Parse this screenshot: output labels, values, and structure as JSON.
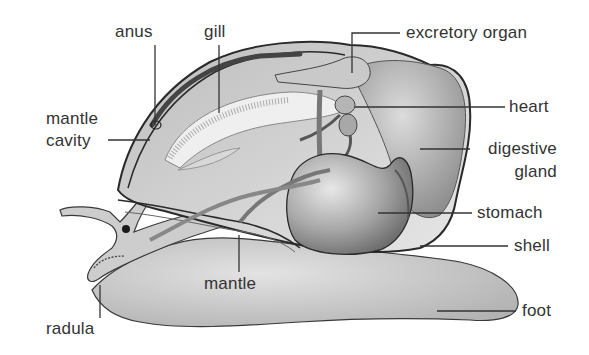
{
  "diagram": {
    "labels": [
      {
        "id": "anus",
        "text": "anus"
      },
      {
        "id": "gill",
        "text": "gill"
      },
      {
        "id": "mantle-cavity-1",
        "text": "mantle"
      },
      {
        "id": "mantle-cavity-2",
        "text": "cavity"
      },
      {
        "id": "excretory-organ",
        "text": "excretory organ"
      },
      {
        "id": "heart",
        "text": "heart"
      },
      {
        "id": "digestive-gland-1",
        "text": "digestive"
      },
      {
        "id": "digestive-gland-2",
        "text": "gland"
      },
      {
        "id": "stomach",
        "text": "stomach"
      },
      {
        "id": "shell",
        "text": "shell"
      },
      {
        "id": "mantle",
        "text": "mantle"
      },
      {
        "id": "foot",
        "text": "foot"
      },
      {
        "id": "radula",
        "text": "radula"
      }
    ],
    "colors": {
      "label_text": "#333333",
      "leader_line": "#333333",
      "body_fill": "#cfcfcf",
      "organ_fill": "#a9a9a9",
      "outline": "#2a2a2a"
    }
  }
}
